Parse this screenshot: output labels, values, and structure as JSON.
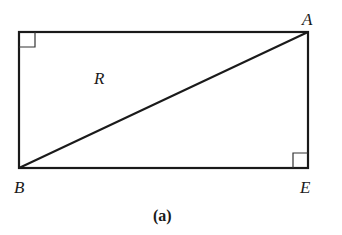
{
  "figure": {
    "caption": "(a)",
    "region_label": "R",
    "points": {
      "A": {
        "label": "A",
        "x": 308,
        "y": 32
      },
      "B": {
        "label": "B",
        "x": 19,
        "y": 168
      },
      "E": {
        "label": "E",
        "x": 308,
        "y": 168
      },
      "topLeft": {
        "x": 19,
        "y": 32
      }
    },
    "right_angle_marks": [
      "top-left corner",
      "E"
    ],
    "segments": [
      "rectangle perimeter",
      "diagonal BA"
    ],
    "stroke_color": "#1a1a1a"
  }
}
